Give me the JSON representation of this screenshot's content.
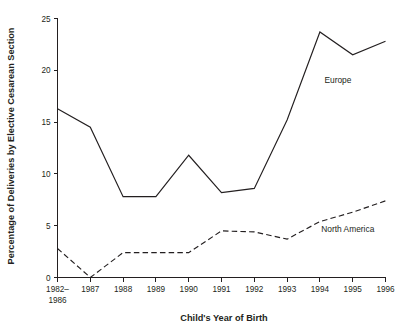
{
  "chart_data": {
    "type": "line",
    "title": "",
    "xlabel": "Child's Year of Birth",
    "ylabel": "Percentage of Deliveries by Elective Cesarean Section",
    "categories": [
      "1982–\n1986",
      "1987",
      "1988",
      "1989",
      "1990",
      "1991",
      "1992",
      "1993",
      "1994",
      "1995",
      "1996"
    ],
    "x_tick_labels": [
      {
        "line1": "1982–",
        "line2": "1986"
      },
      {
        "line1": "1987",
        "line2": ""
      },
      {
        "line1": "1988",
        "line2": ""
      },
      {
        "line1": "1989",
        "line2": ""
      },
      {
        "line1": "1990",
        "line2": ""
      },
      {
        "line1": "1991",
        "line2": ""
      },
      {
        "line1": "1992",
        "line2": ""
      },
      {
        "line1": "1993",
        "line2": ""
      },
      {
        "line1": "1994",
        "line2": ""
      },
      {
        "line1": "1995",
        "line2": ""
      },
      {
        "line1": "1996",
        "line2": ""
      }
    ],
    "y_tick_labels": [
      "0",
      "5",
      "10",
      "15",
      "20",
      "25"
    ],
    "y_tick_values": [
      0,
      5,
      10,
      15,
      20,
      25
    ],
    "ylim": [
      0,
      25
    ],
    "grid": false,
    "legend_position": "inline-annotation",
    "series": [
      {
        "name": "Europe",
        "style": "solid",
        "color": "#231f20",
        "values": [
          16.3,
          14.5,
          7.8,
          7.8,
          11.8,
          8.2,
          8.6,
          15.2,
          23.7,
          21.5,
          22.8
        ],
        "annotation": {
          "text": "Europe",
          "x_index": 8.55,
          "y_value": 18.8
        }
      },
      {
        "name": "North America",
        "style": "dashed",
        "color": "#231f20",
        "values": [
          2.8,
          0.0,
          2.4,
          2.4,
          2.4,
          4.5,
          4.4,
          3.7,
          5.4,
          6.3,
          7.4
        ],
        "annotation": {
          "text": "North America",
          "x_index": 8.85,
          "y_value": 4.4
        }
      }
    ]
  },
  "colors": {
    "ink": "#231f20",
    "background": "#ffffff"
  }
}
